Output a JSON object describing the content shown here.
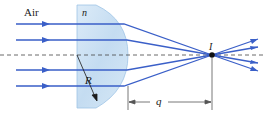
{
  "diagram": {
    "medium_label": "Air",
    "index_label": "n",
    "radius_label": "R",
    "image_label": "I",
    "distance_label": "q",
    "colors": {
      "ray": "#3a5fc8",
      "lens_fill": "#cfe3f4",
      "lens_edge": "#9ec4e6",
      "axis": "#444444",
      "point": "#111111"
    }
  }
}
